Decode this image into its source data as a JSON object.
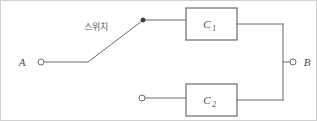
{
  "figure": {
    "kind": "circuit-diagram",
    "width": 317,
    "height": 121,
    "background_color": "#ffffff",
    "line_color": "#6b6b6b",
    "border_color": "#d0d0d0"
  },
  "terminals": {
    "left": {
      "label": "A",
      "marker": "open-circle",
      "x": 38,
      "y": 62
    },
    "right": {
      "label": "B",
      "marker": "open-circle",
      "x": 295,
      "y": 62
    },
    "lower_branch_input": {
      "label": "",
      "marker": "open-circle",
      "x": 140,
      "y": 98
    },
    "switch_contact": {
      "label": "",
      "marker": "filled-dot",
      "x": 143,
      "y": 20
    }
  },
  "switch": {
    "label": "스위치",
    "label_x": 96,
    "label_y": 30,
    "pivot_x": 88,
    "pivot_y": 62,
    "contact_x": 143,
    "contact_y": 20,
    "state": "open"
  },
  "components": [
    {
      "id": "c1",
      "label": "C",
      "subscript": "1",
      "box_x": 186,
      "box_y": 8,
      "box_width": 51,
      "box_height": 32,
      "branch": "upper"
    },
    {
      "id": "c2",
      "label": "C",
      "subscript": "2",
      "box_x": 186,
      "box_y": 84,
      "box_width": 51,
      "box_height": 32,
      "branch": "lower"
    }
  ],
  "bus": {
    "x": 283,
    "top_y": 24,
    "bottom_y": 100,
    "junction_y": 62
  }
}
